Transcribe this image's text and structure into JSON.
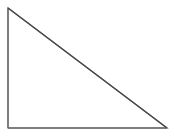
{
  "figure": {
    "name": "right-triangle",
    "background_color": "#ffffff",
    "width": 174,
    "height": 136,
    "shape": {
      "type": "triangle",
      "variant": "right-triangle",
      "filled": false,
      "fill_color": "none",
      "stroke_color": "#595959",
      "stroke_width": 1.2,
      "right_angle_vertex": "bottom-left",
      "vertices": [
        {
          "name": "apex-top-left",
          "x": 8,
          "y": 8
        },
        {
          "name": "corner-bottom-left",
          "x": 8,
          "y": 128
        },
        {
          "name": "corner-bottom-right",
          "x": 167,
          "y": 128
        }
      ],
      "points_attr": "8,8 8,128 167,128",
      "edges": [
        {
          "name": "vertical-leg",
          "from": "apex-top-left",
          "to": "corner-bottom-left",
          "length_px": 120,
          "stroke_color": "#6e6e6e"
        },
        {
          "name": "horizontal-leg",
          "from": "corner-bottom-left",
          "to": "corner-bottom-right",
          "length_px": 159,
          "stroke_color": "#6e6e6e"
        },
        {
          "name": "hypotenuse",
          "from": "corner-bottom-right",
          "to": "apex-top-left",
          "length_px": 199,
          "stroke_color": "#4a4a4a"
        }
      ]
    },
    "labels": [],
    "annotations": []
  }
}
